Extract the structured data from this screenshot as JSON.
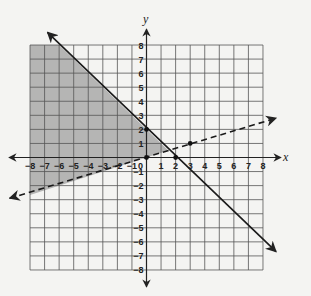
{
  "chart_data": {
    "type": "line",
    "title": "",
    "xlabel": "x",
    "ylabel": "y",
    "xlim": [
      -8,
      8
    ],
    "ylim": [
      -8,
      8
    ],
    "grid": true,
    "legend": null,
    "x_ticks": [
      -8,
      -7,
      -6,
      -5,
      -4,
      -3,
      -2,
      -1,
      0,
      1,
      2,
      3,
      4,
      5,
      6,
      7,
      8
    ],
    "y_ticks": [
      -8,
      -7,
      -6,
      -5,
      -4,
      -3,
      -2,
      -1,
      1,
      2,
      3,
      4,
      5,
      6,
      7,
      8
    ],
    "series": [
      {
        "name": "boundary-solid",
        "equation": "y = -x + 2",
        "slope": -1,
        "intercept": 2,
        "style": "solid",
        "arrow_ends": [
          [
            -6.8,
            8.9
          ],
          [
            8.9,
            -6.7
          ]
        ],
        "points": [
          [
            0,
            2
          ],
          [
            2,
            0
          ]
        ]
      },
      {
        "name": "boundary-dashed",
        "equation": "y = x/3",
        "slope": 0.3333,
        "intercept": 0,
        "style": "dashed",
        "arrow_ends": [
          [
            -9.4,
            -2.9
          ],
          [
            8.9,
            2.8
          ]
        ],
        "points": [
          [
            0,
            0
          ],
          [
            3,
            1
          ]
        ]
      }
    ],
    "shaded_region": {
      "description": "y <= -x + 2 and y > x/3",
      "color": "#a9a9a9",
      "polygon": [
        [
          -8,
          8
        ],
        [
          -6,
          8
        ],
        [
          1.5,
          0.5
        ],
        [
          -8,
          -2.6667
        ]
      ]
    },
    "marked_points": [
      [
        0,
        0
      ],
      [
        0,
        2
      ],
      [
        2,
        0
      ],
      [
        3,
        1
      ]
    ]
  },
  "colors": {
    "background": "#f4f4f2",
    "grid": "#555555",
    "axis": "#222222",
    "shade": "#a9a9a9"
  },
  "layout": {
    "origin_px": [
      146.5,
      157.5
    ],
    "unit_x_px": 14.56,
    "unit_y_px": 14.06
  },
  "labels": {
    "x_axis": "x",
    "y_axis": "y",
    "origin": "0"
  }
}
